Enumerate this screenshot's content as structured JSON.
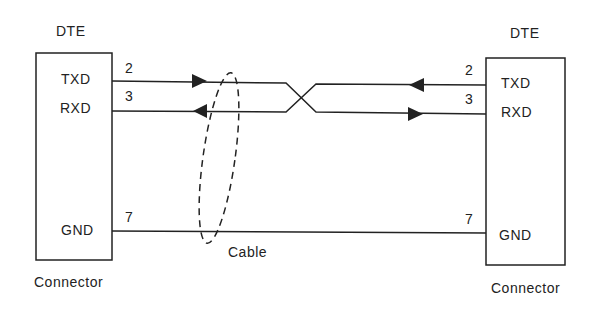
{
  "left": {
    "title": "DTE",
    "caption": "Connector",
    "signals": {
      "txd": "TXD",
      "rxd": "RXD",
      "gnd": "GND"
    },
    "pins": {
      "txd": "2",
      "rxd": "3",
      "gnd": "7"
    }
  },
  "right": {
    "title": "DTE",
    "caption": "Connector",
    "signals": {
      "txd": "TXD",
      "rxd": "RXD",
      "gnd": "GND"
    },
    "pins": {
      "txd": "2",
      "rxd": "3",
      "gnd": "7"
    }
  },
  "cable_label": "Cable",
  "colors": {
    "line": "#222222"
  }
}
